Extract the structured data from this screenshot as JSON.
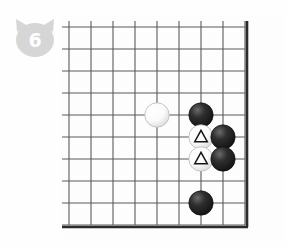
{
  "page": {
    "background_color": "#fefefe"
  },
  "badge": {
    "icon": "cat-head-badge-icon",
    "number": "6",
    "shape_color": "#d4d4d4",
    "number_color": "#ffffff"
  },
  "board": {
    "name": "go-board",
    "game": "go",
    "line_color": "#5a5a5a",
    "edge_color": "#2b2b2b",
    "board_color": "#fdfdfd",
    "origin_x": 7,
    "origin_y": 11,
    "spacing": 22,
    "cols": 9,
    "rows": 10,
    "edges": {
      "top": false,
      "left": false,
      "right": true,
      "bottom": true
    },
    "stones": [
      {
        "id": "white-stone-1",
        "color": "white",
        "col": 4,
        "row": 4,
        "mark": ""
      },
      {
        "id": "black-stone-1",
        "color": "black",
        "col": 6,
        "row": 4,
        "mark": ""
      },
      {
        "id": "white-stone-2",
        "color": "white",
        "col": 6,
        "row": 5,
        "mark": "triangle"
      },
      {
        "id": "black-stone-2",
        "color": "black",
        "col": 7,
        "row": 5,
        "mark": ""
      },
      {
        "id": "white-stone-3",
        "color": "white",
        "col": 6,
        "row": 6,
        "mark": "triangle"
      },
      {
        "id": "black-stone-3",
        "color": "black",
        "col": 7,
        "row": 6,
        "mark": ""
      },
      {
        "id": "black-stone-4",
        "color": "black",
        "col": 6,
        "row": 8,
        "mark": ""
      }
    ],
    "marks_legend": {
      "triangle": "triangle-marked-stone"
    }
  }
}
